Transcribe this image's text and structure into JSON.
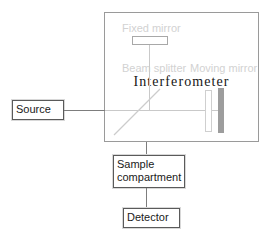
{
  "diagram": {
    "colors": {
      "ink": "#1a1a1a",
      "ghost": "#d2d2d2",
      "line": "#7d7d7d",
      "beam": "#c9c9c9",
      "mirror_solid": "#9d9d9d",
      "background": "#ffffff"
    }
  },
  "interferometer": {
    "title": "Interferometer",
    "labels": {
      "fixed_mirror": "Fixed mirror",
      "beam_splitter": "Beam splitter",
      "moving_mirror": "Moving mirror"
    }
  },
  "blocks": {
    "source": "Source",
    "sample_compartment_line1": "Sample",
    "sample_compartment_line2": "compartment",
    "detector": "Detector"
  }
}
